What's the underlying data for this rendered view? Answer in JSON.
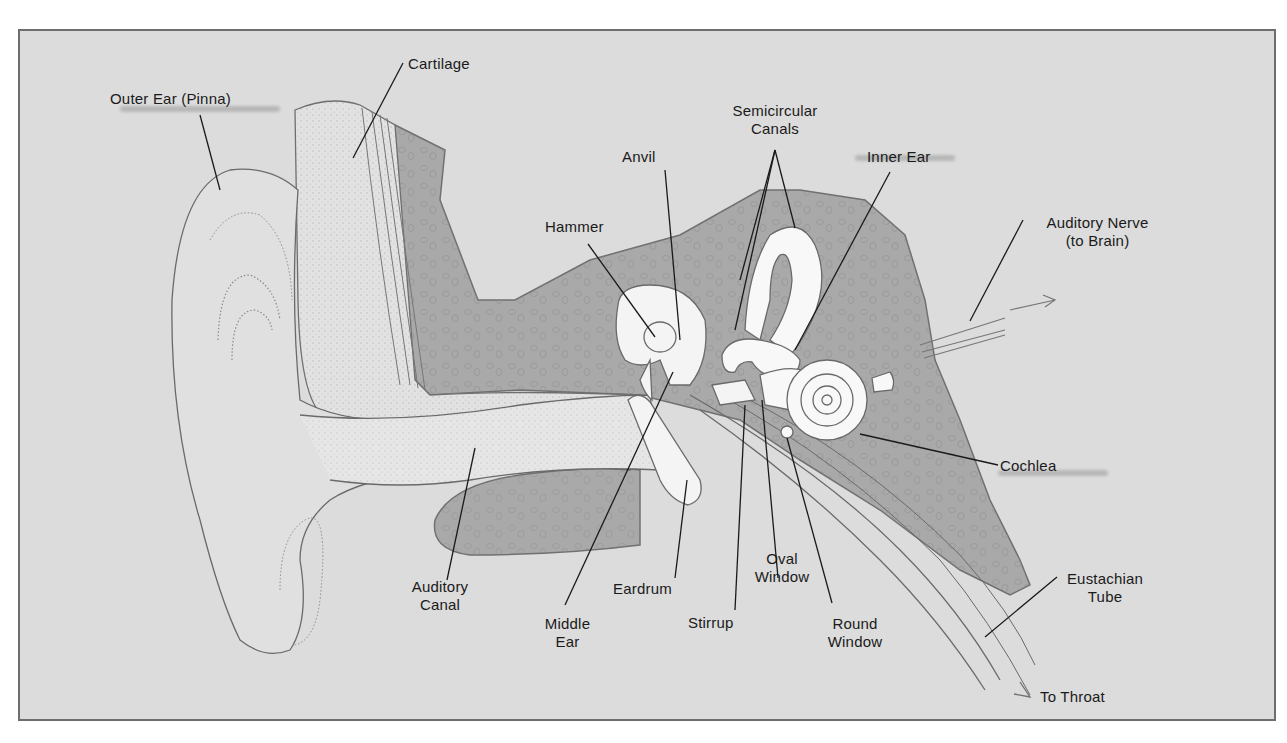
{
  "figure": {
    "colors": {
      "background": "#dcdcdc",
      "border": "#6e6e6e",
      "bone": "#a9a9a9",
      "soft_tissue": "#e4e4e4",
      "inner_ear": "#fafafa",
      "outline": "#6a6a6a",
      "leader_line": "#1a1a1a"
    }
  },
  "labels": {
    "outer_ear": "Outer Ear (Pinna)",
    "cartilage": "Cartilage",
    "semicircular_1": "Semicircular",
    "semicircular_2": "Canals",
    "anvil": "Anvil",
    "inner_ear": "Inner Ear",
    "hammer": "Hammer",
    "auditory_nerve_1": "Auditory Nerve",
    "auditory_nerve_2": "(to Brain)",
    "cochlea": "Cochlea",
    "auditory_canal_1": "Auditory",
    "auditory_canal_2": "Canal",
    "middle_ear_1": "Middle",
    "middle_ear_2": "Ear",
    "eardrum": "Eardrum",
    "oval_window_1": "Oval",
    "oval_window_2": "Window",
    "stirrup": "Stirrup",
    "round_window_1": "Round",
    "round_window_2": "Window",
    "eustachian_1": "Eustachian",
    "eustachian_2": "Tube",
    "to_throat": "To Throat"
  }
}
